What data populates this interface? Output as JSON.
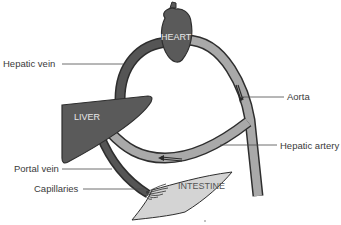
{
  "diagram": {
    "organs": {
      "heart": "HEART",
      "liver": "LIVER",
      "intestine": "INTESTINE"
    },
    "labels": {
      "hepatic_vein": "Hepatic vein",
      "aorta": "Aorta",
      "hepatic_artery": "Hepatic artery",
      "portal_vein": "Portal vein",
      "capillaries": "Capillaries"
    },
    "colors": {
      "deoxygenated_vessel": "#555555",
      "oxygenated_vessel": "#a9a9a9",
      "organ_fill": "#5a5a5a",
      "intestine_fill": "#d4d4d4",
      "outline": "#2e2e2e",
      "leader_line": "#4a4a4a"
    },
    "arrows": [
      {
        "location": "aorta",
        "direction": "down"
      },
      {
        "location": "hepatic_artery",
        "direction": "left"
      }
    ]
  }
}
